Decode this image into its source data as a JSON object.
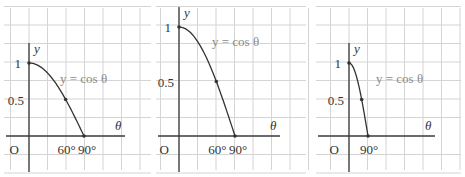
{
  "chart_data": [
    {
      "type": "line",
      "title": "",
      "equation": "y = cos θ",
      "xlabel": "θ",
      "ylabel": "y",
      "origin_label": "O",
      "x_ticks": [
        "60°",
        "90°"
      ],
      "y_ticks": [
        "1",
        "0.5"
      ],
      "points": [
        {
          "x": 0,
          "y": 1
        },
        {
          "x": 60,
          "y": 0.5
        },
        {
          "x": 90,
          "y": 0
        }
      ],
      "grid": true,
      "panel": {
        "x0": 0,
        "x1": 155,
        "axisX": 29,
        "axisY": 136,
        "y1px": 63,
        "x90px": 84
      }
    },
    {
      "type": "line",
      "title": "",
      "equation": "y = cos θ",
      "xlabel": "θ",
      "ylabel": "y",
      "origin_label": "O",
      "x_ticks": [
        "60°",
        "90°"
      ],
      "y_ticks": [
        "1",
        "0.5"
      ],
      "points": [
        {
          "x": 0,
          "y": 1
        },
        {
          "x": 60,
          "y": 0.5
        },
        {
          "x": 90,
          "y": 0
        }
      ],
      "grid": true,
      "panel": {
        "x0": 152,
        "x1": 310,
        "axisX": 179,
        "axisY": 136,
        "y1px": 27,
        "x90px": 235
      }
    },
    {
      "type": "line",
      "title": "",
      "equation": "y = cos θ",
      "xlabel": "θ",
      "ylabel": "y",
      "origin_label": "O",
      "x_ticks": [
        "90°"
      ],
      "y_ticks": [
        "1",
        "0.5"
      ],
      "points": [
        {
          "x": 0,
          "y": 1
        },
        {
          "x": 60,
          "y": 0.5
        },
        {
          "x": 90,
          "y": 0
        }
      ],
      "grid": true,
      "panel": {
        "x0": 312,
        "x1": 465,
        "axisX": 349,
        "axisY": 136,
        "y1px": 63,
        "x90px": 368
      }
    }
  ]
}
